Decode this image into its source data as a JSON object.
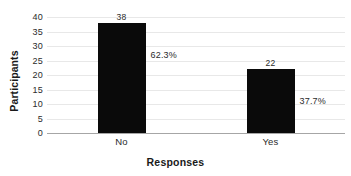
{
  "chart_data": {
    "type": "bar",
    "title": "",
    "xlabel": "Responses",
    "ylabel": "Participants",
    "categories": [
      "No",
      "Yes"
    ],
    "values": [
      38,
      22
    ],
    "value_labels": [
      "38",
      "22"
    ],
    "percent_labels": [
      "62.3%",
      "37.7%"
    ],
    "ylim": [
      0,
      40
    ],
    "ytick_labels": [
      "0",
      "5",
      "10",
      "15",
      "20",
      "25",
      "30",
      "35",
      "40"
    ],
    "ytick_values": [
      0,
      5,
      10,
      15,
      20,
      25,
      30,
      35,
      40
    ],
    "grid": true,
    "legend": false,
    "bar_color": "#0a0a0a",
    "gridline_color": "#e8e8e8",
    "axis_color": "#a6a6a6",
    "text_color": "#2b2b2b",
    "background": "#ffffff"
  }
}
